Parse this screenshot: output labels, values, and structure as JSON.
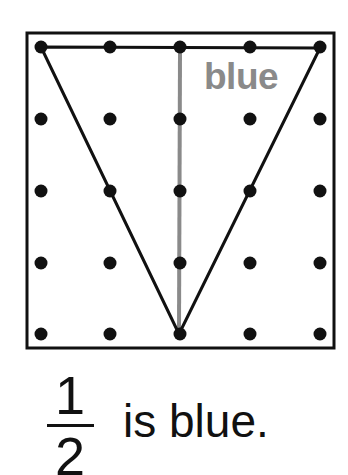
{
  "geoboard": {
    "frame": {
      "x1": 27,
      "y1": 33,
      "x2": 334,
      "y2": 348
    },
    "grid": {
      "columns": [
        41,
        110,
        180,
        250,
        320
      ],
      "rows": [
        47,
        119,
        191,
        263,
        334
      ]
    },
    "shape": {
      "type": "triangle",
      "vertices": [
        [
          41,
          47
        ],
        [
          320,
          48
        ],
        [
          179,
          334
        ]
      ],
      "stroke": "#111111"
    },
    "divider": {
      "from": [
        180,
        47
      ],
      "to": [
        179,
        334
      ],
      "color": "#8a8a8a"
    },
    "region_label": "blue",
    "region_label_color": "#8a8a8a"
  },
  "caption": {
    "numerator": "1",
    "denominator": "2",
    "text": "is blue."
  }
}
